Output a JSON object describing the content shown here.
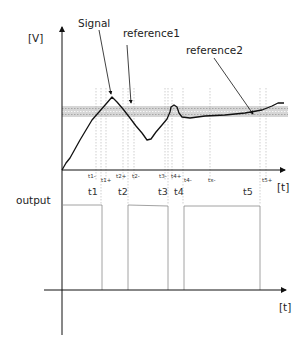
{
  "diagram": {
    "upper_plot": {
      "y_axis_label": "[V]",
      "x_axis_label": "[t]",
      "annotations": [
        {
          "text": "Signal",
          "arrow_to": "signal-peak"
        },
        {
          "text": "reference1",
          "arrow_to": "band-after-peak"
        },
        {
          "text": "reference2",
          "arrow_to": "band-right"
        }
      ],
      "reference_band": "grey tolerance band with dotted reference lines",
      "signal_shape": "rises from origin, peaks above band, falls below, rises with small overshoot, then settles slowly rising within band",
      "small_time_markers": [
        "t1-",
        "t1+",
        "t2+",
        "t2-",
        "t3-",
        "t4+",
        "t4-",
        "tx-",
        "t5+"
      ],
      "main_time_markers": [
        "t1",
        "t2",
        "t3",
        "t4",
        "t5"
      ]
    },
    "lower_plot": {
      "y_axis_label": "output",
      "x_axis_label": "[t]",
      "pulses": [
        {
          "start": "0",
          "end": "t1"
        },
        {
          "start": "t2",
          "end": "t3"
        },
        {
          "start": "t4",
          "end": "t5"
        }
      ]
    },
    "colors": {
      "line": "#111111",
      "band": "#d0d0d0",
      "dotted": "#9a9a9a",
      "pulse": "#8a8a8a"
    }
  }
}
